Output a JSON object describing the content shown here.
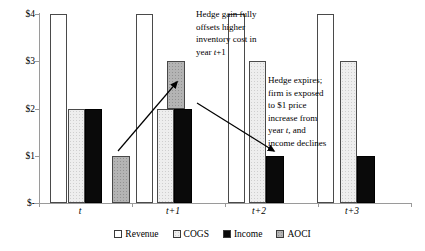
{
  "chart_data": {
    "type": "bar",
    "title": "",
    "xlabel": "",
    "ylabel": "",
    "ylim": [
      0,
      4
    ],
    "grid": false,
    "legend_position": "bottom",
    "categories": [
      "t",
      "t+1",
      "t+2",
      "t+3"
    ],
    "y_ticks": {
      "labels": [
        "$4",
        "$3",
        "$2",
        "$1",
        "$-"
      ],
      "values": [
        4,
        3,
        2,
        1,
        0
      ]
    },
    "series": [
      {
        "name": "Revenue",
        "color": "#ffffff",
        "values": [
          4,
          4,
          4,
          4
        ]
      },
      {
        "name": "COGS",
        "color": "#eeeeee",
        "values": [
          2,
          2,
          3,
          3
        ]
      },
      {
        "name": "Income",
        "color": "#0a0a0a",
        "values": [
          2,
          2,
          1,
          1
        ]
      },
      {
        "name": "AOCI",
        "color": "#b4b4b4",
        "values": [
          1,
          1,
          0,
          0
        ],
        "note": "AOCI in year t+1 is drawn as a floating $1 segment from $2 to $3 over the COGS/Income bars"
      }
    ],
    "annotations": [
      {
        "name": "hedge-gain-note",
        "text": "Hedge gain fully offsets higher inventory cost in year t+1",
        "lines": [
          [
            {
              "t": "Hedge gain fully"
            }
          ],
          [
            {
              "t": "offsets higher"
            }
          ],
          [
            {
              "t": "inventory cost in"
            }
          ],
          [
            {
              "t": "year "
            },
            {
              "t": "t",
              "i": true
            },
            {
              "t": "+1"
            }
          ]
        ]
      },
      {
        "name": "hedge-expires-note",
        "text": "Hedge expires; firm is exposed to $1 price increase from year t, and income declines",
        "lines": [
          [
            {
              "t": "Hedge expires;"
            }
          ],
          [
            {
              "t": "firm is exposed"
            }
          ],
          [
            {
              "t": "to $1 price"
            }
          ],
          [
            {
              "t": "increase from"
            }
          ],
          [
            {
              "t": "year "
            },
            {
              "t": "t",
              "i": true
            },
            {
              "t": ", and"
            }
          ],
          [
            {
              "t": "income declines"
            }
          ]
        ]
      }
    ]
  },
  "legend": {
    "items": [
      {
        "label": "Revenue",
        "series": "revenue",
        "color": "#ffffff"
      },
      {
        "label": "COGS",
        "series": "cogs",
        "color": "#eeeeee"
      },
      {
        "label": "Income",
        "series": "income",
        "color": "#0a0a0a"
      },
      {
        "label": "AOCI",
        "series": "aoci",
        "color": "#b4b4b4"
      }
    ]
  }
}
